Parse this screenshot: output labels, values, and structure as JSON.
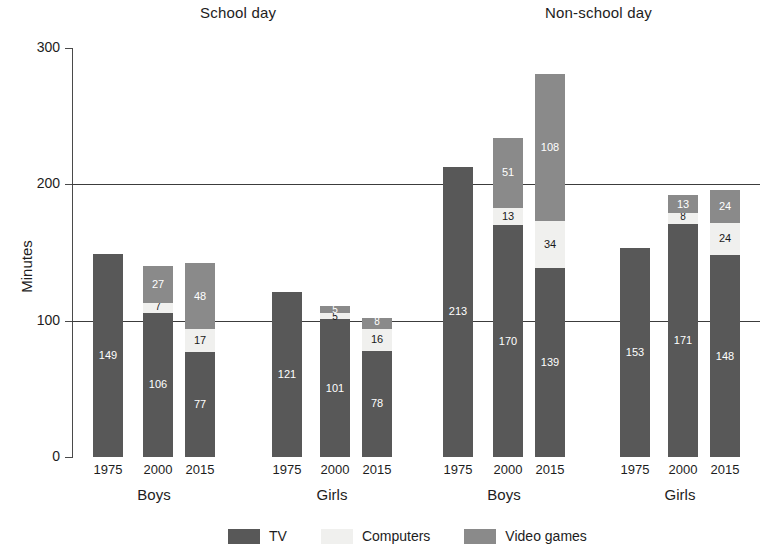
{
  "chart_data": {
    "type": "bar",
    "title": "",
    "subtitle": "",
    "xlabel": "",
    "ylabel": "Minutes",
    "ylim": [
      0,
      300
    ],
    "yticks": [
      0,
      100,
      200,
      300
    ],
    "grid": "horizontal gridlines at 100 and 200",
    "legend_position": "bottom-center",
    "stacked": true,
    "panels": [
      {
        "title": "School day",
        "groups": [
          {
            "label": "Boys",
            "categories": [
              "1975",
              "2000",
              "2015"
            ],
            "series": [
              {
                "name": "TV",
                "values": [
                  149,
                  106,
                  77
                ]
              },
              {
                "name": "Computers",
                "values": [
                  null,
                  7,
                  17
                ]
              },
              {
                "name": "Video games",
                "values": [
                  null,
                  27,
                  48
                ]
              }
            ],
            "totals": [
              149,
              140,
              142
            ]
          },
          {
            "label": "Girls",
            "categories": [
              "1975",
              "2000",
              "2015"
            ],
            "series": [
              {
                "name": "TV",
                "values": [
                  121,
                  101,
                  78
                ]
              },
              {
                "name": "Computers",
                "values": [
                  null,
                  5,
                  16
                ]
              },
              {
                "name": "Video games",
                "values": [
                  null,
                  5,
                  8
                ]
              }
            ],
            "totals": [
              121,
              111,
              102
            ]
          }
        ]
      },
      {
        "title": "Non-school day",
        "groups": [
          {
            "label": "Boys",
            "categories": [
              "1975",
              "2000",
              "2015"
            ],
            "series": [
              {
                "name": "TV",
                "values": [
                  213,
                  170,
                  139
                ]
              },
              {
                "name": "Computers",
                "values": [
                  null,
                  13,
                  34
                ]
              },
              {
                "name": "Video games",
                "values": [
                  null,
                  51,
                  108
                ]
              }
            ],
            "totals": [
              213,
              234,
              281
            ]
          },
          {
            "label": "Girls",
            "categories": [
              "1975",
              "2000",
              "2015"
            ],
            "series": [
              {
                "name": "TV",
                "values": [
                  153,
                  171,
                  148
                ]
              },
              {
                "name": "Computers",
                "values": [
                  null,
                  8,
                  24
                ]
              },
              {
                "name": "Video games",
                "values": [
                  null,
                  13,
                  24
                ]
              }
            ],
            "totals": [
              153,
              192,
              196
            ]
          }
        ]
      }
    ],
    "legend": [
      {
        "name": "TV",
        "color": "#585858"
      },
      {
        "name": "Computers",
        "color": "#f0f0ee"
      },
      {
        "name": "Video games",
        "color": "#8a8a8a"
      }
    ]
  },
  "axis": {
    "y_title": "Minutes",
    "tick_labels": [
      "300",
      "200",
      "100",
      "0"
    ]
  },
  "panels": {
    "school": {
      "title": "School day"
    },
    "nonschool": {
      "title": "Non-school day"
    }
  },
  "groups": {
    "boys": "Boys",
    "girls": "Girls"
  },
  "years": {
    "y1975": "1975",
    "y2000": "2000",
    "y2015": "2015"
  },
  "legend": {
    "tv": "TV",
    "computers": "Computers",
    "video_games": "Video games"
  },
  "colors": {
    "tv": "#585858",
    "computers": "#f0f0ee",
    "video_games": "#8a8a8a",
    "axis": "#4a4a4a",
    "text": "#1d1d1d",
    "background": "#ffffff"
  }
}
